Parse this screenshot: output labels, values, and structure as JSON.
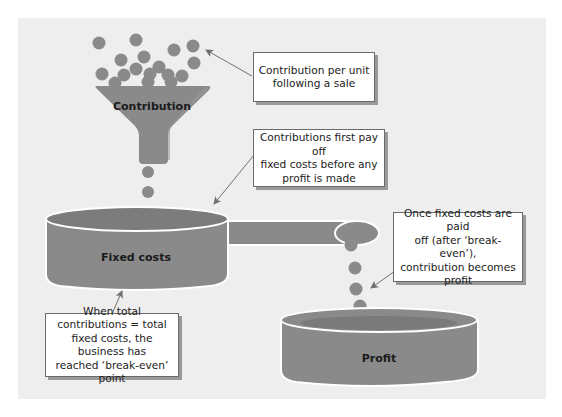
{
  "diagram": {
    "colors": {
      "background": "#eeeeee",
      "shape_fill": "#8a8a8a",
      "shape_top": "#7a7a7a",
      "outline": "#ffffff",
      "arrow": "#707070"
    },
    "funnel": {
      "label": "Contribution"
    },
    "containers": {
      "fixed_costs": {
        "label": "Fixed costs"
      },
      "profit": {
        "label": "Profit"
      }
    },
    "callouts": {
      "contribution_per_unit": {
        "lines": [
          "Contribution per unit",
          "following a sale"
        ]
      },
      "first_pay_off": {
        "lines": [
          "Contributions first pay off",
          "fixed costs before any",
          "profit is made"
        ]
      },
      "becomes_profit": {
        "lines": [
          "Once fixed costs are paid",
          "off (after ‘break-even’),",
          "contribution becomes",
          "profit"
        ]
      },
      "break_even": {
        "lines": [
          "When total",
          "contributions = total",
          "fixed costs, the business has",
          "reached ‘break-even’ point"
        ]
      }
    }
  }
}
